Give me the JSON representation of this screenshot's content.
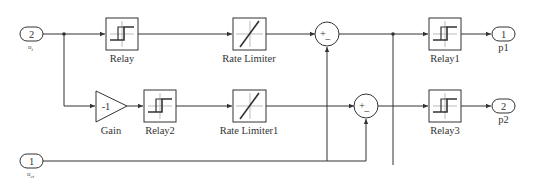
{
  "diagram": {
    "inports": [
      {
        "id": "in2",
        "number": "2",
        "label_main": "u",
        "label_sub": "t"
      },
      {
        "id": "in1",
        "number": "1",
        "label_main": "u",
        "label_sub": "ct"
      }
    ],
    "outports": [
      {
        "id": "out1",
        "number": "1",
        "label": "p1"
      },
      {
        "id": "out2",
        "number": "2",
        "label": "p2"
      }
    ],
    "blocks": {
      "relay": "Relay",
      "rate_limiter": "Rate Limiter",
      "relay1": "Relay1",
      "gain": "Gain",
      "gain_value": "-1",
      "relay2": "Relay2",
      "rate_limiter1": "Rate Limiter1",
      "relay3": "Relay3"
    },
    "sums": [
      {
        "id": "sum_top",
        "signs": [
          "+",
          "−"
        ]
      },
      {
        "id": "sum_bottom",
        "signs": [
          "+",
          "−"
        ]
      }
    ]
  }
}
